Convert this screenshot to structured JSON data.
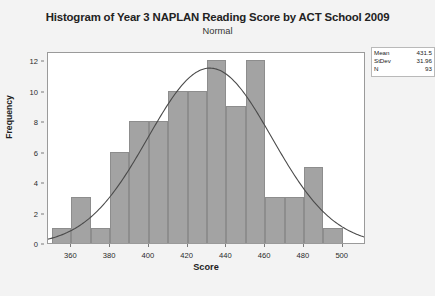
{
  "chart_data": {
    "type": "bar",
    "title": "Histogram of Year 3 NAPLAN Reading Score by ACT School 2009",
    "subtitle": "Normal",
    "xlabel": "Score",
    "ylabel": "Frequency",
    "xlim": [
      348,
      512
    ],
    "ylim": [
      0,
      12.6
    ],
    "grid": false,
    "bin_width": 10,
    "categories": [
      "350",
      "360",
      "370",
      "380",
      "390",
      "400",
      "410",
      "420",
      "430",
      "440",
      "450",
      "460",
      "470",
      "480",
      "490",
      "500"
    ],
    "bin_starts": [
      350,
      360,
      370,
      380,
      390,
      400,
      410,
      420,
      430,
      440,
      450,
      460,
      470,
      480,
      490,
      500
    ],
    "values": [
      1,
      3,
      1,
      6,
      8,
      8,
      10,
      10,
      12,
      9,
      12,
      3,
      3,
      5,
      1,
      0
    ],
    "xticks": [
      360,
      380,
      400,
      420,
      440,
      460,
      480,
      500
    ],
    "yticks": [
      0,
      2,
      4,
      6,
      8,
      10,
      12
    ],
    "overlay": {
      "name": "Normal",
      "mean": 431.5,
      "stdev": 31.96,
      "n": 93,
      "scale_bin_width": 10
    },
    "legend_position": "top-right",
    "bar_color": "#a3a3a3",
    "curve_color": "#4a4a4a"
  },
  "stats": {
    "rows": [
      {
        "label": "Mean",
        "value": "431.5"
      },
      {
        "label": "StDev",
        "value": "31.96"
      },
      {
        "label": "N",
        "value": "93"
      }
    ]
  }
}
